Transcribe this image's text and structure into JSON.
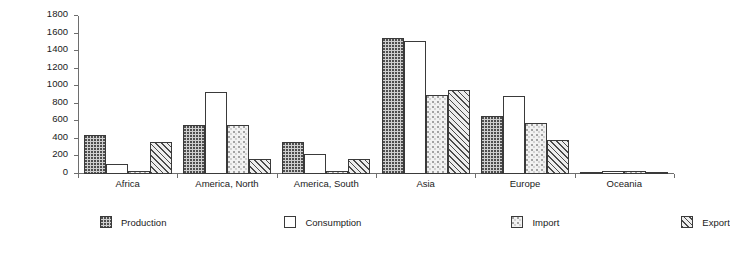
{
  "chart_data": {
    "type": "bar",
    "title": "",
    "xlabel": "",
    "ylabel": "Million metric tons",
    "ylim": [
      0,
      1800
    ],
    "ytick_step": 200,
    "yticks": [
      0,
      200,
      400,
      600,
      800,
      1000,
      1200,
      1400,
      1600,
      1800
    ],
    "grid": false,
    "legend_position": "bottom",
    "categories": [
      "Africa",
      "America, North",
      "America, South",
      "Asia",
      "Europe",
      "Oceania"
    ],
    "series": [
      {
        "name": "Production",
        "pattern": "dotted",
        "values": [
          450,
          560,
          360,
          1555,
          665,
          25
        ]
      },
      {
        "name": "Consumption",
        "pattern": "solid-white",
        "values": [
          115,
          940,
          225,
          1520,
          890,
          35
        ]
      },
      {
        "name": "Import",
        "pattern": "speckled",
        "values": [
          35,
          555,
          35,
          900,
          585,
          30
        ]
      },
      {
        "name": "Export",
        "pattern": "diagonal-hatch",
        "values": [
          370,
          175,
          170,
          955,
          385,
          20
        ]
      }
    ]
  },
  "legend": {
    "items": [
      {
        "label": "Production"
      },
      {
        "label": "Consumption"
      },
      {
        "label": "Import"
      },
      {
        "label": "Export"
      }
    ]
  },
  "colors": {
    "axis": "#6e6e6e",
    "bar_outline": "#3a3a3a",
    "text": "#1a1a1a",
    "background": "#ffffff"
  }
}
